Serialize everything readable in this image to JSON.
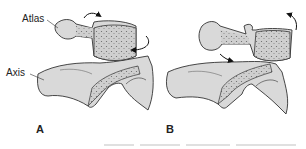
{
  "figure": {
    "labels": {
      "atlas": "Atlas",
      "axis": "Axis"
    },
    "panels": [
      {
        "id": "A",
        "label": "A",
        "description": "Atlas rotating on axis (neutral)"
      },
      {
        "id": "B",
        "label": "B",
        "description": "Atlas rotated/displaced relative to axis"
      }
    ],
    "colors": {
      "bone_fill": "#d9d9d9",
      "cancellous_fill": "#c4c4c4",
      "outline": "#333333",
      "background": "#ffffff"
    }
  }
}
